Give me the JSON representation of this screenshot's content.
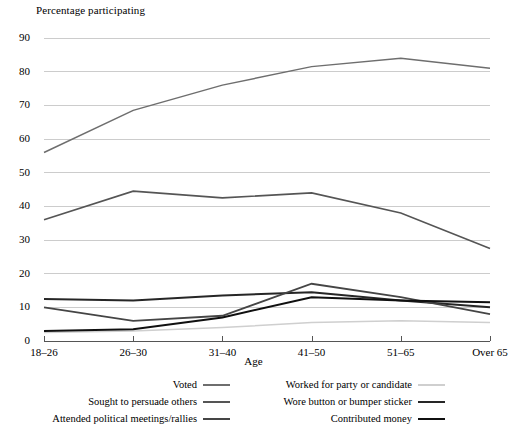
{
  "chart_data": {
    "type": "line",
    "title": "",
    "ylabel": "Percentage participating",
    "xlabel": "Age",
    "categories": [
      "18–26",
      "26–30",
      "31–40",
      "41–50",
      "51–65",
      "Over 65"
    ],
    "ylim": [
      0,
      90
    ],
    "yticks": [
      0,
      10,
      20,
      30,
      40,
      50,
      60,
      70,
      80,
      90
    ],
    "grid": "horizontal",
    "legend_position": "bottom",
    "series": [
      {
        "name": "Voted",
        "color": "#6e6e6e",
        "width": 1.5,
        "values": [
          56,
          68.5,
          76,
          81.5,
          84,
          81
        ]
      },
      {
        "name": "Worked for party or candidate",
        "color": "#cfcfcf",
        "width": 1.5,
        "values": [
          2.5,
          3,
          4,
          5.5,
          6,
          5.5
        ]
      },
      {
        "name": "Sought to persuade others",
        "color": "#555555",
        "width": 1.6,
        "values": [
          36,
          44.5,
          42.5,
          44,
          38,
          27.5
        ]
      },
      {
        "name": "Wore button or bumper sticker",
        "color": "#262626",
        "width": 2.0,
        "values": [
          12.5,
          12,
          13.5,
          14.5,
          12,
          10
        ]
      },
      {
        "name": "Attended political meetings/rallies",
        "color": "#454545",
        "width": 1.8,
        "values": [
          10,
          6,
          7.5,
          17,
          13,
          8
        ]
      },
      {
        "name": "Contributed money",
        "color": "#101010",
        "width": 2.0,
        "values": [
          3,
          3.5,
          7,
          13,
          12,
          11.5
        ]
      }
    ]
  },
  "legend": {
    "left_column": [
      "Voted",
      "Sought to persuade others",
      "Attended political meetings/rallies"
    ],
    "right_column": [
      "Worked for party or candidate",
      "Wore button or bumper sticker",
      "Contributed money"
    ]
  },
  "style": {
    "grid_color": "#cccccc",
    "axis_color": "#555555",
    "background": "#ffffff"
  }
}
